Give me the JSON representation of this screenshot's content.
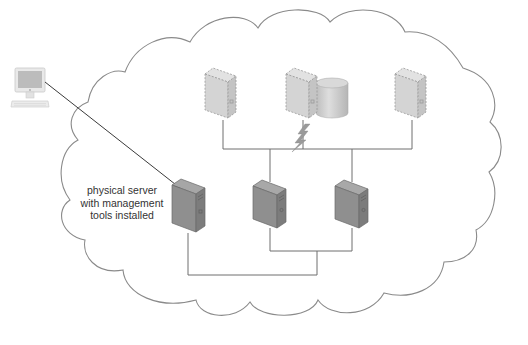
{
  "diagram": {
    "type": "network-cloud",
    "colors": {
      "background": "#ffffff",
      "cloud_outline": "#8a8a8a",
      "connector": "#6e6e6e",
      "arrow": "#3a3a3a",
      "virtual_server_fill": "#d4d4d4",
      "physical_server_fill": "#8f8f8f",
      "management_server_fill": "#8a8a8a",
      "storage_fill": "#c8c8c8",
      "lightning": "#9a9a9a",
      "workstation": "#cfcfcf",
      "text": "#333333"
    },
    "annotation": {
      "lines": [
        "physical server",
        "with management",
        "tools installed"
      ]
    },
    "nodes": [
      {
        "id": "workstation",
        "icon": "desktop-computer-icon",
        "style": "solid-light"
      },
      {
        "id": "virtual-server-1",
        "icon": "server-tower-icon",
        "style": "dashed-virtual"
      },
      {
        "id": "virtual-server-2",
        "icon": "server-tower-icon",
        "style": "dashed-virtual",
        "attached": "database-cylinder-icon"
      },
      {
        "id": "virtual-server-3",
        "icon": "server-tower-icon",
        "style": "dashed-virtual"
      },
      {
        "id": "management-server",
        "icon": "server-tower-icon",
        "style": "solid-dark"
      },
      {
        "id": "physical-server-2",
        "icon": "server-tower-icon",
        "style": "solid-dark"
      },
      {
        "id": "physical-server-3",
        "icon": "server-tower-icon",
        "style": "solid-dark"
      },
      {
        "id": "virtualization-link",
        "icon": "lightning-bolt-icon"
      }
    ],
    "edges": [
      {
        "from": "workstation",
        "to": "management-server",
        "style": "arrow"
      },
      {
        "from": "virtual-server-1",
        "to": "virtual-bus",
        "style": "line"
      },
      {
        "from": "virtual-server-2",
        "to": "virtual-bus",
        "style": "line"
      },
      {
        "from": "virtual-server-3",
        "to": "virtual-bus",
        "style": "line"
      },
      {
        "from": "virtual-bus",
        "to": "physical-server-2",
        "style": "line"
      },
      {
        "from": "virtual-bus",
        "to": "physical-server-3",
        "style": "line"
      },
      {
        "from": "physical-server-2",
        "to": "physical-server-3",
        "style": "line"
      },
      {
        "from": "management-server",
        "to": "physical-bus",
        "style": "line"
      }
    ]
  }
}
